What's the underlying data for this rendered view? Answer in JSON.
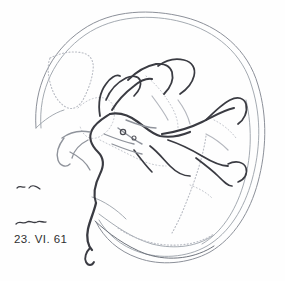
{
  "figure": {
    "kind": "cerebral-angiogram",
    "view": "lateral",
    "modality": "x-ray-angiography",
    "background_color": "#fefefe",
    "ink_color": "#33343a",
    "vessel_color": "#3a3b42",
    "faint_color": "#b9bcc4",
    "skull_color": "#8c9099"
  },
  "annotations": {
    "date_label": "23. VI. 61",
    "date_color": "#2e2e30",
    "marks": [
      {
        "name": "squiggle-mark-upper"
      },
      {
        "name": "squiggle-mark-lower"
      }
    ]
  },
  "structures": [
    {
      "name": "skull-vault-outer",
      "style": "solid-thin"
    },
    {
      "name": "skull-vault-inner",
      "style": "solid-thin"
    },
    {
      "name": "skull-base",
      "style": "solid-thin"
    },
    {
      "name": "frontal-sinus-outline",
      "style": "dotted"
    },
    {
      "name": "sphenoid-sinus-outline",
      "style": "dotted"
    },
    {
      "name": "transverse-sinus",
      "style": "dotted"
    },
    {
      "name": "internal-carotid-siphon",
      "style": "solid-dark"
    },
    {
      "name": "middle-cerebral-branches",
      "style": "solid-dark"
    },
    {
      "name": "anterior-cerebral-artery",
      "style": "solid-dark"
    },
    {
      "name": "posterior-branches",
      "style": "solid-dark"
    }
  ]
}
